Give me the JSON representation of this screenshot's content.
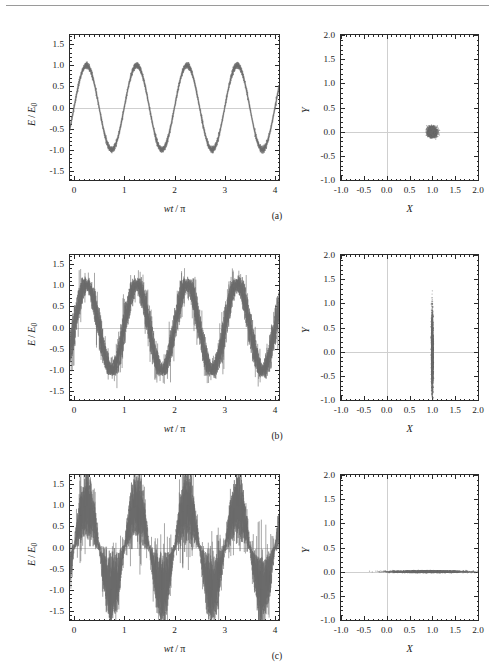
{
  "figure": {
    "caption_note": "",
    "trace_color": "#6b6b6b",
    "axis_color": "#2a2a2a",
    "zero_line_color": "#cfcfcf"
  },
  "rows": [
    {
      "id": "a",
      "sub_caption": "(a)",
      "state": "coherent",
      "left": {
        "xlabel": "wt/π",
        "ylabel": "E/E",
        "ylabel_sub": "0",
        "xticks": [
          "0",
          "1",
          "2",
          "3",
          "4"
        ],
        "xtickvals": [
          0,
          1,
          2,
          3,
          4
        ],
        "yticks": [
          "1.5",
          "1.0",
          "0.5",
          "0.0",
          "-0.5",
          "-1.0",
          "-1.5"
        ],
        "ytickvals": [
          1.5,
          1.0,
          0.5,
          0.0,
          -0.5,
          -1.0,
          -1.5
        ],
        "xlim": [
          -0.08,
          4.08
        ],
        "ylim": [
          -1.72,
          1.72
        ],
        "amplitude": 1.0,
        "cycles": 2,
        "noise_amp": 0.07,
        "noise_type": "uniform"
      },
      "right": {
        "xlabel": "X",
        "ylabel": "Y",
        "xticks": [
          "-1.0",
          "-0.5",
          "0.0",
          "0.5",
          "1.0",
          "1.5",
          "2.0"
        ],
        "xtickvals": [
          -1.0,
          -0.5,
          0.0,
          0.5,
          1.0,
          1.5,
          2.0
        ],
        "yticks": [
          "2.0",
          "1.5",
          "1.0",
          "0.5",
          "0.0",
          "-0.5",
          "-1.0"
        ],
        "ytickvals": [
          2.0,
          1.5,
          1.0,
          0.5,
          0.0,
          -0.5,
          -1.0
        ],
        "xlim": [
          -1.0,
          2.0
        ],
        "ylim": [
          -1.0,
          2.0
        ],
        "blob_center": [
          1.0,
          0.0
        ],
        "blob_rx": 0.11,
        "blob_ry": 0.11
      }
    },
    {
      "id": "b",
      "sub_caption": "(b)",
      "state": "phase-squeezed",
      "left": {
        "xlabel": "wt/π",
        "ylabel": "E/E",
        "ylabel_sub": "0",
        "xticks": [
          "0",
          "1",
          "2",
          "3",
          "4"
        ],
        "xtickvals": [
          0,
          1,
          2,
          3,
          4
        ],
        "yticks": [
          "1.5",
          "1.0",
          "0.5",
          "0.0",
          "-0.5",
          "-1.0",
          "-1.5"
        ],
        "ytickvals": [
          1.5,
          1.0,
          0.5,
          0.0,
          -0.5,
          -1.0,
          -1.5
        ],
        "xlim": [
          -0.08,
          4.08
        ],
        "ylim": [
          -1.72,
          1.72
        ],
        "amplitude": 1.0,
        "cycles": 2,
        "noise_amp": 0.3,
        "noise_type": "phase-modulated"
      },
      "right": {
        "xlabel": "X",
        "ylabel": "Y",
        "xticks": [
          "-1.0",
          "-0.5",
          "0.0",
          "0.5",
          "1.0",
          "1.5",
          "2.0"
        ],
        "xtickvals": [
          -1.0,
          -0.5,
          0.0,
          0.5,
          1.0,
          1.5,
          2.0
        ],
        "yticks": [
          "2.0",
          "1.5",
          "1.0",
          "0.5",
          "0.0",
          "-0.5",
          "-1.0"
        ],
        "ytickvals": [
          2.0,
          1.5,
          1.0,
          0.5,
          0.0,
          -0.5,
          -1.0
        ],
        "xlim": [
          -1.0,
          2.0
        ],
        "ylim": [
          -1.0,
          2.0
        ],
        "blob_center": [
          1.0,
          0.0
        ],
        "blob_rx": 0.022,
        "blob_ry": 0.87
      }
    },
    {
      "id": "c",
      "sub_caption": "(c)",
      "state": "amplitude-squeezed",
      "left": {
        "xlabel": "wt/π",
        "ylabel": "E/E",
        "ylabel_sub": "0",
        "xticks": [
          "0",
          "1",
          "2",
          "3",
          "4"
        ],
        "xtickvals": [
          0,
          1,
          2,
          3,
          4
        ],
        "yticks": [
          "1.5",
          "1.0",
          "0.5",
          "0.0",
          "-0.5",
          "-1.0",
          "-1.5"
        ],
        "ytickvals": [
          1.5,
          1.0,
          0.5,
          0.0,
          -0.5,
          -1.0,
          -1.5
        ],
        "xlim": [
          -0.08,
          4.08
        ],
        "ylim": [
          -1.72,
          1.72
        ],
        "amplitude": 1.0,
        "cycles": 2,
        "noise_amp": 0.62,
        "noise_type": "amplitude-modulated"
      },
      "right": {
        "xlabel": "X",
        "ylabel": "Y",
        "xticks": [
          "-1.0",
          "-0.5",
          "0.0",
          "0.5",
          "1.0",
          "1.5",
          "2.0"
        ],
        "xtickvals": [
          -1.0,
          -0.5,
          0.0,
          0.5,
          1.0,
          1.5,
          2.0
        ],
        "yticks": [
          "2.0",
          "1.5",
          "1.0",
          "0.5",
          "0.0",
          "-0.5",
          "-1.0"
        ],
        "ytickvals": [
          2.0,
          1.5,
          1.0,
          0.5,
          0.0,
          -0.5,
          -1.0
        ],
        "xlim": [
          -1.0,
          2.0
        ],
        "ylim": [
          -1.0,
          2.0
        ],
        "blob_center": [
          0.95,
          0.0
        ],
        "blob_rx": 0.93,
        "blob_ry": 0.022
      }
    }
  ],
  "chart_data": {
    "type": "line",
    "title": "",
    "panels": [
      {
        "row": "a",
        "kind": "time-series",
        "xlabel": "wt/π",
        "ylabel": "E/E0",
        "xlim": [
          -0.08,
          4.08
        ],
        "ylim": [
          -1.72,
          1.72
        ],
        "xticks": [
          0,
          1,
          2,
          3,
          4
        ],
        "yticks": [
          -1.5,
          -1.0,
          -0.5,
          0.0,
          0.5,
          1.0,
          1.5
        ],
        "description": "sin(2π x) with uniform small noise band of ±0.07",
        "series": [
          {
            "name": "E/E0",
            "formula": "sin(2*pi*x)",
            "noise_sigma": 0.07
          }
        ],
        "grid": false,
        "legend": false
      },
      {
        "row": "a",
        "kind": "scatter",
        "xlabel": "X",
        "ylabel": "Y",
        "xlim": [
          -1.0,
          2.0
        ],
        "ylim": [
          -1.0,
          2.0
        ],
        "xticks": [
          -1.0,
          -0.5,
          0.0,
          0.5,
          1.0,
          1.5,
          2.0
        ],
        "yticks": [
          -1.0,
          -0.5,
          0.0,
          0.5,
          1.0,
          1.5,
          2.0
        ],
        "description": "isotropic coherent-state uncertainty disc centred at (1.0, 0.0), radius ≈ 0.11",
        "blob": {
          "cx": 1.0,
          "cy": 0.0,
          "rx": 0.11,
          "ry": 0.11
        },
        "grid": false,
        "legend": false
      },
      {
        "row": "b",
        "kind": "time-series",
        "xlabel": "wt/π",
        "ylabel": "E/E0",
        "xlim": [
          -0.08,
          4.08
        ],
        "ylim": [
          -1.72,
          1.72
        ],
        "xticks": [
          0,
          1,
          2,
          3,
          4
        ],
        "yticks": [
          -1.5,
          -1.0,
          -0.5,
          0.0,
          0.5,
          1.0,
          1.5
        ],
        "description": "sin(2π x) with noise maximal at zero crossings (phase-squeezed → amplitude noise large)",
        "series": [
          {
            "name": "E/E0",
            "formula": "sin(2*pi*x)",
            "noise_sigma": 0.3
          }
        ],
        "grid": false,
        "legend": false
      },
      {
        "row": "b",
        "kind": "scatter",
        "xlabel": "X",
        "ylabel": "Y",
        "xlim": [
          -1.0,
          2.0
        ],
        "ylim": [
          -1.0,
          2.0
        ],
        "xticks": [
          -1.0,
          -0.5,
          0.0,
          0.5,
          1.0,
          1.5,
          2.0
        ],
        "yticks": [
          -1.0,
          -0.5,
          0.0,
          0.5,
          1.0,
          1.5,
          2.0
        ],
        "description": "vertical (Y-elongated) error ellipse at (1.0, 0.0): rx ≈ 0.02, ry ≈ 0.87",
        "blob": {
          "cx": 1.0,
          "cy": 0.0,
          "rx": 0.022,
          "ry": 0.87
        },
        "grid": false,
        "legend": false
      },
      {
        "row": "c",
        "kind": "time-series",
        "xlabel": "wt/π",
        "ylabel": "E/E0",
        "xlim": [
          -0.08,
          4.08
        ],
        "ylim": [
          -1.72,
          1.72
        ],
        "xticks": [
          0,
          1,
          2,
          3,
          4
        ],
        "yticks": [
          -1.5,
          -1.0,
          -0.5,
          0.0,
          0.5,
          1.0,
          1.5
        ],
        "description": "sin(2π x) with noise maximal at the wave crests/troughs and vanishing at zero crossings (amplitude-squeezed)",
        "series": [
          {
            "name": "E/E0",
            "formula": "sin(2*pi*x)",
            "noise_sigma": 0.62
          }
        ],
        "grid": false,
        "legend": false
      },
      {
        "row": "c",
        "kind": "scatter",
        "xlabel": "X",
        "ylabel": "Y",
        "xlim": [
          -1.0,
          2.0
        ],
        "ylim": [
          -1.0,
          2.0
        ],
        "xticks": [
          -1.0,
          -0.5,
          0.0,
          0.5,
          1.0,
          1.5,
          2.0
        ],
        "yticks": [
          -1.0,
          -0.5,
          0.0,
          0.5,
          1.0,
          1.5,
          2.0
        ],
        "description": "horizontal (X-elongated) error ellipse spanning X ≈ 0.0 … 1.9 at Y = 0",
        "blob": {
          "cx": 0.95,
          "cy": 0.0,
          "rx": 0.93,
          "ry": 0.022
        },
        "grid": false,
        "legend": false
      }
    ]
  }
}
